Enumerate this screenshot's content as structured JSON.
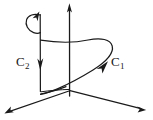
{
  "figure": {
    "kind": "line-diagram",
    "background_color": "#ffffff",
    "ink_color": "#1a1a1a",
    "width": 153,
    "height": 120
  },
  "labels": {
    "c1": {
      "base": "C",
      "sub": "1"
    },
    "c2": {
      "base": "C",
      "sub": "2"
    }
  },
  "axes": [
    {
      "name": "vertical-axis",
      "arrow": "up"
    },
    {
      "name": "left-axis",
      "arrow": "down-left"
    },
    {
      "name": "right-axis",
      "arrow": "down-right"
    }
  ],
  "curves": [
    {
      "name": "helix-curve-c1",
      "arrow": "up-right",
      "label": "C1"
    },
    {
      "name": "vertical-line-c2",
      "arrow": "down",
      "label": "C2"
    },
    {
      "name": "top-hook",
      "arrow": "up-right"
    }
  ]
}
